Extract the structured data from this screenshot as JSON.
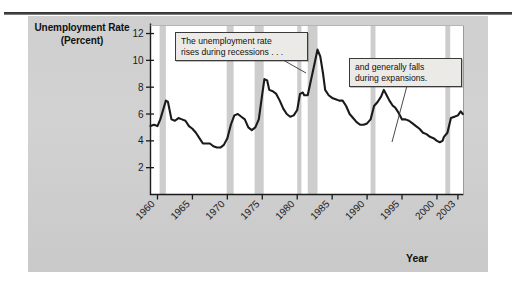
{
  "figure": {
    "y_axis_label": "Unemployment\nRate\n(Percent)",
    "x_axis_label": "Year"
  },
  "annotations": [
    {
      "id": "callout-1",
      "text": "The unemployment rate\nrises during recessions . . ."
    },
    {
      "id": "callout-2",
      "text": "and generally falls\nduring expansions."
    }
  ],
  "colors": {
    "panel_background": "#d0d0d0",
    "plot_background": "#ffffff",
    "recession_band": "#cdcdcd",
    "line": "#1a1a1a",
    "axis": "#1a1a1a",
    "callout_background": "#eceae6",
    "rule": "#2a2a2a"
  },
  "chart_data": {
    "type": "line",
    "title": "",
    "xlabel": "Year",
    "ylabel": "Unemployment Rate (Percent)",
    "xlim": [
      1959.0,
      2003.8
    ],
    "ylim": [
      0,
      12.6
    ],
    "xticks": [
      1960,
      1965,
      1970,
      1975,
      1980,
      1985,
      1990,
      1995,
      2000,
      2003
    ],
    "xticklabels": [
      "1960",
      "1965",
      "1970",
      "1975",
      "1980",
      "1985",
      "1990",
      "1995",
      "2000",
      "2003"
    ],
    "yticks": [
      2,
      4,
      6,
      8,
      10,
      12
    ],
    "yticklabels": [
      "2",
      "4",
      "6",
      "8",
      "10",
      "12"
    ],
    "grid": false,
    "legend": null,
    "series": [
      {
        "name": "Unemployment Rate",
        "x": [
          1959.0,
          1959.5,
          1960.0,
          1960.4,
          1960.8,
          1961.2,
          1961.5,
          1962.0,
          1962.5,
          1963.0,
          1963.5,
          1964.0,
          1964.5,
          1965.0,
          1965.5,
          1966.0,
          1966.5,
          1967.0,
          1967.5,
          1968.0,
          1968.5,
          1969.0,
          1969.5,
          1970.0,
          1970.5,
          1971.0,
          1971.5,
          1972.0,
          1972.5,
          1973.0,
          1973.5,
          1974.0,
          1974.5,
          1975.0,
          1975.3,
          1975.7,
          1976.0,
          1976.5,
          1977.0,
          1977.5,
          1978.0,
          1978.5,
          1979.0,
          1979.5,
          1980.0,
          1980.4,
          1980.8,
          1981.0,
          1981.5,
          1982.0,
          1982.5,
          1982.9,
          1983.3,
          1983.7,
          1984.0,
          1984.5,
          1985.0,
          1985.5,
          1986.0,
          1986.5,
          1987.0,
          1987.5,
          1988.0,
          1988.5,
          1989.0,
          1989.5,
          1990.0,
          1990.5,
          1991.0,
          1991.5,
          1992.0,
          1992.4,
          1992.8,
          1993.2,
          1993.7,
          1994.0,
          1994.5,
          1995.0,
          1995.5,
          1996.0,
          1996.5,
          1997.0,
          1997.5,
          1998.0,
          1998.5,
          1999.0,
          1999.5,
          2000.0,
          2000.4,
          2000.8,
          2001.0,
          2001.5,
          2002.0,
          2002.5,
          2003.0,
          2003.4,
          2003.7
        ],
        "y": [
          5.1,
          5.2,
          5.1,
          5.6,
          6.3,
          7.0,
          6.9,
          5.6,
          5.5,
          5.7,
          5.6,
          5.5,
          5.1,
          4.9,
          4.6,
          4.2,
          3.8,
          3.8,
          3.8,
          3.6,
          3.5,
          3.5,
          3.7,
          4.2,
          5.2,
          5.9,
          6.0,
          5.8,
          5.6,
          5.0,
          4.8,
          5.0,
          5.6,
          7.5,
          8.6,
          8.5,
          7.8,
          7.7,
          7.5,
          7.0,
          6.4,
          6.0,
          5.8,
          5.9,
          6.3,
          7.5,
          7.6,
          7.4,
          7.4,
          8.6,
          9.8,
          10.8,
          10.3,
          9.0,
          7.8,
          7.4,
          7.2,
          7.1,
          7.0,
          7.0,
          6.6,
          6.0,
          5.7,
          5.4,
          5.2,
          5.2,
          5.3,
          5.6,
          6.6,
          6.9,
          7.3,
          7.8,
          7.4,
          7.0,
          6.6,
          6.5,
          6.1,
          5.6,
          5.6,
          5.5,
          5.3,
          5.1,
          4.9,
          4.6,
          4.5,
          4.3,
          4.2,
          4.0,
          3.9,
          4.0,
          4.3,
          4.6,
          5.7,
          5.8,
          5.9,
          6.2,
          6.0
        ]
      }
    ],
    "recession_bands": [
      {
        "start": 1960.3,
        "end": 1961.2
      },
      {
        "start": 1969.9,
        "end": 1970.9
      },
      {
        "start": 1973.9,
        "end": 1975.2
      },
      {
        "start": 1980.0,
        "end": 1980.6
      },
      {
        "start": 1981.5,
        "end": 1982.9
      },
      {
        "start": 1990.5,
        "end": 1991.2
      },
      {
        "start": 2001.2,
        "end": 2001.9
      }
    ]
  }
}
